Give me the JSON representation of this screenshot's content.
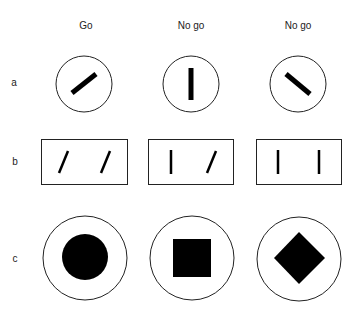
{
  "columns": [
    {
      "label": "Go"
    },
    {
      "label": "No go"
    },
    {
      "label": "No go"
    }
  ],
  "rows": [
    {
      "label": "a",
      "type": "circle-bar",
      "items": [
        "bar tilted 45° right",
        "bar vertical",
        "bar tilted 45° left"
      ]
    },
    {
      "label": "b",
      "type": "rect-line-pairs",
      "items": [
        "two tilted lines",
        "vertical + tilted line",
        "two vertical lines"
      ]
    },
    {
      "label": "c",
      "type": "circle-shape",
      "items": [
        "filled circle",
        "filled square",
        "filled diamond"
      ]
    }
  ],
  "colors": {
    "stroke": "#222222",
    "fill": "#000000",
    "background": "#ffffff"
  }
}
